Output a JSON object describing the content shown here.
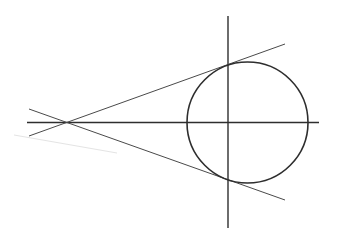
{
  "diagram": {
    "type": "geometry",
    "background": "#ffffff",
    "stroke_color": "#2e2e2e",
    "thin_stroke_color": "#4a4a4a",
    "smudge_color": "#e4e4e4",
    "circle": {
      "cx": 247.5,
      "cy": 122.5,
      "r": 60.5
    },
    "horizontal_axis": {
      "x1": 27,
      "y1": 122.5,
      "x2": 319,
      "y2": 122.5
    },
    "vertical_axis": {
      "x1": 228,
      "y1": 16,
      "x2": 228,
      "y2": 228
    },
    "external_point": {
      "x": 67,
      "y": 122.5
    },
    "upper_tangent": {
      "x1": 29,
      "y1": 136,
      "x2": 285,
      "y2": 44
    },
    "lower_tangent": {
      "x1": 29,
      "y1": 109,
      "x2": 285,
      "y2": 200
    },
    "smudge_line": {
      "x1": 14,
      "y1": 135,
      "x2": 117,
      "y2": 153
    }
  }
}
